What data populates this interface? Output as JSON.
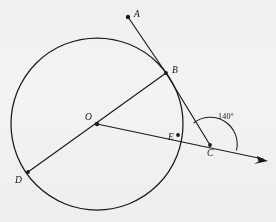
{
  "figure": {
    "type": "geometry-diagram",
    "background_color": "#f4f3f1",
    "ink_color": "#1a1a1a",
    "canvas": {
      "width": 276,
      "height": 222
    },
    "circle": {
      "center_x": 97,
      "center_y": 124,
      "radius": 86
    },
    "points": [
      {
        "id": "A",
        "label": "A",
        "x": 128,
        "y": 17,
        "dot": true,
        "label_x": 134,
        "label_y": 10
      },
      {
        "id": "B",
        "label": "B",
        "x": 166,
        "y": 73,
        "dot": false,
        "label_x": 172,
        "label_y": 66
      },
      {
        "id": "O",
        "label": "O",
        "x": 97,
        "y": 124,
        "dot": true,
        "label_x": 85,
        "label_y": 113
      },
      {
        "id": "C",
        "label": "C",
        "x": 210,
        "y": 145,
        "dot": false,
        "label_x": 207,
        "label_y": 149
      },
      {
        "id": "E",
        "label": "E",
        "x": 178,
        "y": 135,
        "dot": false,
        "label_x": 168,
        "label_y": 133
      },
      {
        "id": "D",
        "label": "D",
        "x": 28,
        "y": 172,
        "dot": false,
        "label_x": 15,
        "label_y": 176
      }
    ],
    "segments": [
      {
        "id": "AB",
        "from": "A",
        "to": "B"
      },
      {
        "id": "BC",
        "from": "B",
        "to": "C"
      },
      {
        "id": "BD",
        "from": "B",
        "to": "D"
      },
      {
        "id": "OC-ray",
        "from": "O",
        "to": "arrow-tip"
      }
    ],
    "ray": {
      "from_x": 97,
      "from_y": 124,
      "to_x": 268,
      "to_y": 161,
      "arrow": true
    },
    "angle": {
      "vertex": "C",
      "label": "140°",
      "value": 140,
      "unit": "degrees",
      "label_x": 218,
      "label_y": 113,
      "arc_radius": 27
    }
  }
}
